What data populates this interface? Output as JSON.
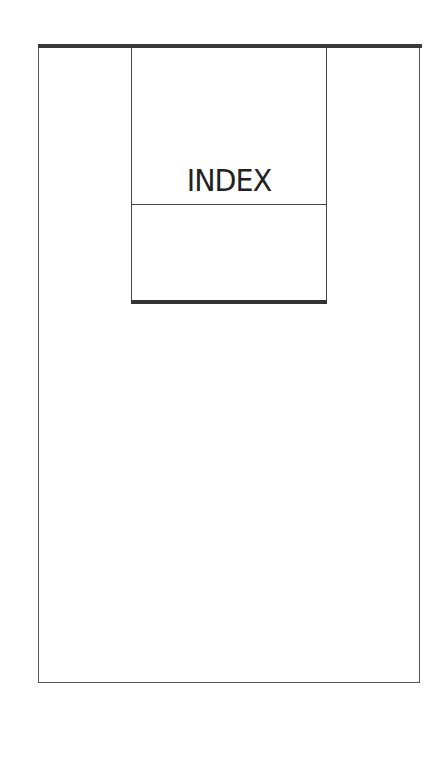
{
  "page": {
    "title": "INDEX",
    "colors": {
      "background": "#ffffff",
      "rule": "#3a3a3a",
      "text": "#222222"
    }
  }
}
